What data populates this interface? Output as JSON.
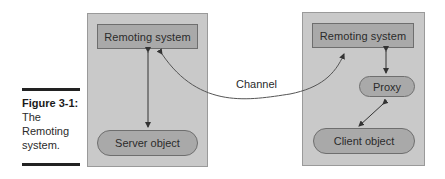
{
  "caption": {
    "title": "Figure 3-1:",
    "text": "The Remoting system."
  },
  "server_side": {
    "remoting_system_label": "Remoting system",
    "server_object_label": "Server object"
  },
  "client_side": {
    "remoting_system_label": "Remoting system",
    "proxy_label": "Proxy",
    "client_object_label": "Client object"
  },
  "connector": {
    "channel_label": "Channel"
  },
  "colors": {
    "panel_fill": "#c9c9c9",
    "box_fill": "#a9a9a9",
    "stroke": "#333333",
    "background": "#ffffff"
  }
}
